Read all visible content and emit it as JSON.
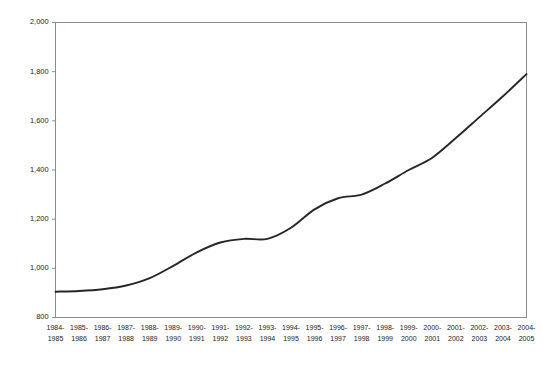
{
  "chart_data": {
    "type": "line",
    "title": "",
    "subtitle": "",
    "xlabel": "",
    "ylabel": "",
    "grid": false,
    "legend": false,
    "legend_position": "none",
    "line_color": "#262626",
    "frame_color": "#8c8c8c",
    "background_color": "#ffffff",
    "ylim": [
      800,
      2000
    ],
    "ytick_values": [
      800,
      1000,
      1200,
      1400,
      1600,
      1800,
      2000
    ],
    "ytick_labels": [
      "800",
      "1,000",
      "1,200",
      "1,400",
      "1,600",
      "1,800",
      "2,000"
    ],
    "categories": [
      "1984-\n1985",
      "1985-\n1986",
      "1986-\n1987",
      "1987-\n1988",
      "1988-\n1989",
      "1989-\n1990",
      "1990-\n1991",
      "1991-\n1992",
      "1992-\n1993",
      "1993-\n1994",
      "1994-\n1995",
      "1995-\n1996",
      "1996-\n1997",
      "1997-\n1998",
      "1998-\n1999",
      "1999-\n2000",
      "2000-\n2001",
      "2001-\n2002",
      "2002-\n2003",
      "2003-\n2004",
      "2004-\n2005"
    ],
    "categories_top": [
      "1984-",
      "1985-",
      "1986-",
      "1987-",
      "1988-",
      "1989-",
      "1990-",
      "1991-",
      "1992-",
      "1993-",
      "1994-",
      "1995-",
      "1996-",
      "1997-",
      "1998-",
      "1999-",
      "2000-",
      "2001-",
      "2002-",
      "2003-",
      "2004-"
    ],
    "categories_bottom": [
      "1985",
      "1986",
      "1987",
      "1988",
      "1989",
      "1990",
      "1991",
      "1992",
      "1993",
      "1994",
      "1995",
      "1996",
      "1997",
      "1998",
      "1999",
      "2000",
      "2001",
      "2002",
      "2003",
      "2004",
      "2005"
    ],
    "values": [
      905,
      908,
      915,
      930,
      960,
      1010,
      1065,
      1105,
      1120,
      1120,
      1165,
      1240,
      1285,
      1300,
      1345,
      1400,
      1450,
      1530,
      1615,
      1700,
      1790
    ]
  }
}
